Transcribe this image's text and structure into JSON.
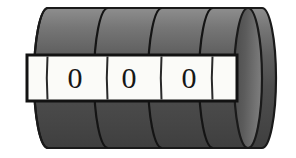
{
  "figure": {
    "name": "mechanical-counter-cylinder",
    "background_color": "#ffffff"
  },
  "cylinder": {
    "name": "counter-drum",
    "outline_color": "#1a1a1a",
    "outline_width": 2,
    "body": {
      "left_x": 48,
      "right_x": 262,
      "top_y": 8,
      "bottom_y": 148,
      "cap_rx": 14,
      "cap_ry": 70
    },
    "shading": {
      "type": "vertical-gradient",
      "stops": [
        {
          "offset": "0%",
          "color": "#8e8e8e"
        },
        {
          "offset": "14%",
          "color": "#767676"
        },
        {
          "offset": "34%",
          "color": "#5e5e5e"
        },
        {
          "offset": "56%",
          "color": "#4e4e4e"
        },
        {
          "offset": "78%",
          "color": "#474747"
        },
        {
          "offset": "100%",
          "color": "#3f3f3f"
        }
      ]
    },
    "end_cap_shading": {
      "type": "horizontal-gradient",
      "stops": [
        {
          "offset": "0%",
          "color": "#4a4a4a"
        },
        {
          "offset": "45%",
          "color": "#5c5c5c"
        },
        {
          "offset": "100%",
          "color": "#787878"
        }
      ]
    },
    "ring_separator_x": [
      108,
      162,
      213
    ],
    "ring_count": 4
  },
  "window": {
    "name": "digit-window",
    "left_x": 27,
    "top_y": 55,
    "width": 210,
    "height": 46,
    "fill_color": "#fbfbf8",
    "border_color": "#121212",
    "border_width": 3,
    "label": "reading window"
  },
  "digits": [
    {
      "name": "digit-0",
      "value": "0",
      "x": 75,
      "y": 78,
      "position": 1
    },
    {
      "name": "digit-1",
      "value": "0",
      "x": 129,
      "y": 78,
      "position": 2
    },
    {
      "name": "digit-2",
      "value": "0",
      "x": 189,
      "y": 78,
      "position": 3
    }
  ],
  "reading": {
    "name": "counter-reading",
    "value": "000",
    "digit_count": 3
  }
}
